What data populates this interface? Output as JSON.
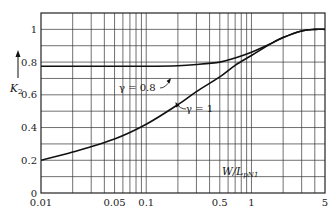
{
  "chart_data": {
    "type": "line",
    "title": "",
    "xlabel": "W/L_pN1",
    "ylabel": "K_2",
    "xscale": "log",
    "xlim": [
      0.01,
      5
    ],
    "ylim": [
      0,
      1.1
    ],
    "grid": true,
    "legend": "inline annotations",
    "x_ticks": [
      {
        "value": 0.01,
        "label": "0.01"
      },
      {
        "value": 0.05,
        "label": "0.05"
      },
      {
        "value": 0.1,
        "label": "0.1"
      },
      {
        "value": 0.5,
        "label": "0.5"
      },
      {
        "value": 1,
        "label": "1"
      },
      {
        "value": 5,
        "label": "5"
      }
    ],
    "y_ticks": [
      {
        "value": 0,
        "label": "0"
      },
      {
        "value": 0.2,
        "label": "0.2"
      },
      {
        "value": 0.4,
        "label": "0.4"
      },
      {
        "value": 0.6,
        "label": "0.6"
      },
      {
        "value": 0.8,
        "label": "0.8"
      },
      {
        "value": 1,
        "label": "1"
      }
    ],
    "series": [
      {
        "name": "γ = 0.8",
        "x": [
          0.01,
          0.02,
          0.05,
          0.1,
          0.2,
          0.3,
          0.5,
          0.7,
          1,
          1.5,
          2,
          3,
          4,
          5
        ],
        "values": [
          0.775,
          0.775,
          0.775,
          0.775,
          0.778,
          0.785,
          0.8,
          0.825,
          0.86,
          0.91,
          0.95,
          0.99,
          1.0,
          1.0
        ]
      },
      {
        "name": "γ = 1",
        "x": [
          0.01,
          0.02,
          0.05,
          0.1,
          0.2,
          0.3,
          0.5,
          0.7,
          1,
          1.5,
          2,
          3,
          4,
          5
        ],
        "values": [
          0.2,
          0.25,
          0.33,
          0.42,
          0.54,
          0.62,
          0.71,
          0.78,
          0.84,
          0.91,
          0.95,
          0.99,
          1.0,
          1.0
        ]
      }
    ],
    "annotations": [
      {
        "text": "γ = 0.8",
        "series": "γ = 0.8"
      },
      {
        "text": "γ = 1",
        "series": "γ = 1"
      }
    ]
  },
  "labels": {
    "y_axis_main": "K",
    "y_axis_sub": "2",
    "x_axis_main": "W/L",
    "x_axis_sub": "pN1",
    "ann_gamma08": "γ = 0.8",
    "ann_gamma1": "γ = 1"
  }
}
